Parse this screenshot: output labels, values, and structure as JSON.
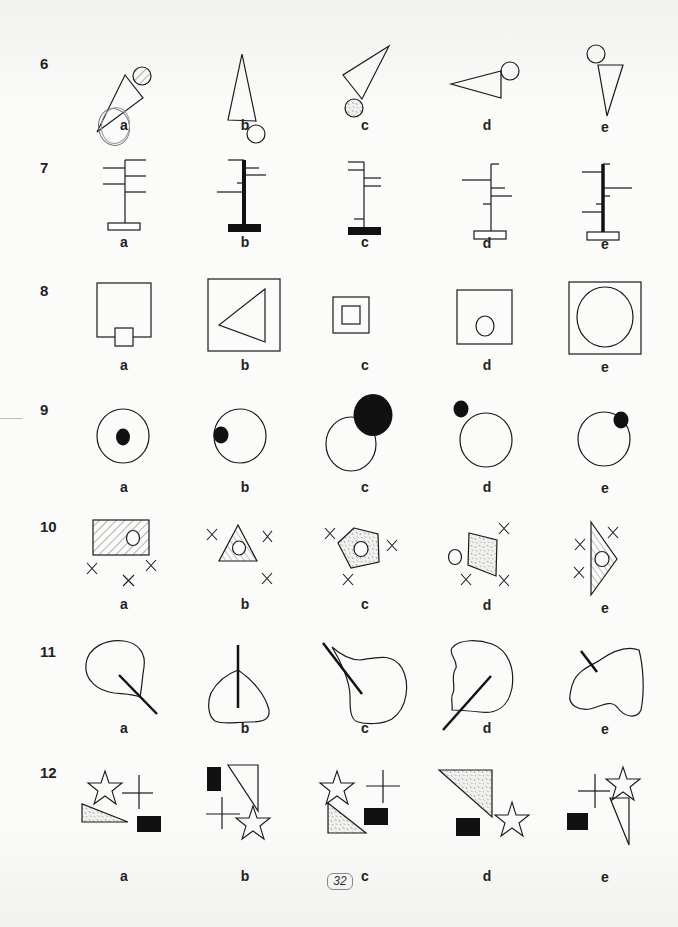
{
  "page": {
    "page_number": "32",
    "selected_answer_q6": "a"
  },
  "questions": [
    {
      "number": "6",
      "options": [
        "a",
        "b",
        "c",
        "d",
        "e"
      ],
      "description": "triangle with circle attached at vertex"
    },
    {
      "number": "7",
      "options": [
        "a",
        "b",
        "c",
        "d",
        "e"
      ],
      "description": "vertical post with branches on a base"
    },
    {
      "number": "8",
      "options": [
        "a",
        "b",
        "c",
        "d",
        "e"
      ],
      "description": "square containing inner shape"
    },
    {
      "number": "9",
      "options": [
        "a",
        "b",
        "c",
        "d",
        "e"
      ],
      "description": "circle with black dot"
    },
    {
      "number": "10",
      "options": [
        "a",
        "b",
        "c",
        "d",
        "e"
      ],
      "description": "shaded polygon with circle and crosses"
    },
    {
      "number": "11",
      "options": [
        "a",
        "b",
        "c",
        "d",
        "e"
      ],
      "description": "blob with stroke"
    },
    {
      "number": "12",
      "options": [
        "a",
        "b",
        "c",
        "d",
        "e"
      ],
      "description": "star, cross, triangle and black rectangle"
    }
  ],
  "colors": {
    "ink": "#1a1a1a",
    "paper": "#fbfbfa",
    "shading": "#666666"
  }
}
